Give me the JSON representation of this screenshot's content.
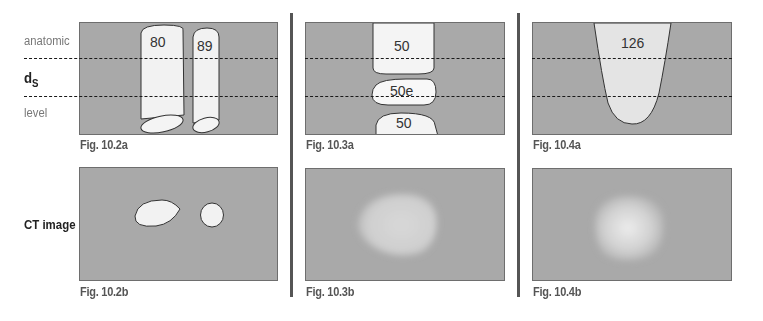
{
  "row_labels": {
    "anatomic": "anatomic",
    "ds_main": "d",
    "ds_sub": "S",
    "level": "level",
    "ct_image": "CT image"
  },
  "figures": [
    {
      "id": "fig-10-2a",
      "caption": "Fig. 10.2a",
      "values": [
        "80",
        "89"
      ]
    },
    {
      "id": "fig-10-2b",
      "caption": "Fig. 10.2b"
    },
    {
      "id": "fig-10-3a",
      "caption": "Fig. 10.3a",
      "values": [
        "50",
        "50e",
        "50"
      ]
    },
    {
      "id": "fig-10-3b",
      "caption": "Fig. 10.3b"
    },
    {
      "id": "fig-10-4a",
      "caption": "Fig. 10.4a",
      "values": [
        "126"
      ]
    },
    {
      "id": "fig-10-4b",
      "caption": "Fig. 10.4b"
    }
  ],
  "colors": {
    "panel_bg": "#a9a9a9",
    "object_fill": "#f2f2f2",
    "separator": "#555555",
    "dash": "#1a1a1a"
  }
}
